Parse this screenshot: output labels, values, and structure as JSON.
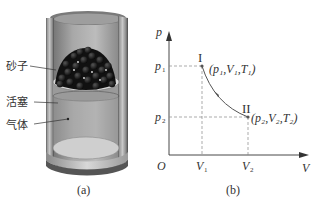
{
  "figure_a": {
    "caption": "(a)",
    "labels": {
      "sand": "砂子",
      "piston": "活塞",
      "gas": "气体"
    }
  },
  "figure_b": {
    "caption": "(b)",
    "axes": {
      "y_label": "p",
      "x_label": "V",
      "origin": "O"
    },
    "ticks": {
      "p1": "p",
      "p1_sub": "1",
      "p2": "p",
      "p2_sub": "2",
      "v1": "V",
      "v1_sub": "1",
      "v2": "V",
      "v2_sub": "2"
    },
    "states": {
      "state1_label": "I",
      "state1_coords": "(p₁,V₁,T₁)",
      "state2_label": "II",
      "state2_coords": "(p₂,V₂,T₂)"
    }
  }
}
